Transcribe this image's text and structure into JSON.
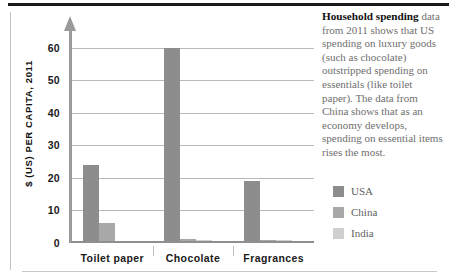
{
  "chart_data": {
    "type": "bar",
    "title": "",
    "xlabel": "",
    "ylabel": "$ (US) PER CAPITA, 2011",
    "ylim": [
      0,
      63
    ],
    "yticks": [
      0,
      10,
      20,
      30,
      40,
      50,
      60
    ],
    "grid": true,
    "legend_position": "right",
    "categories": [
      "Toilet paper",
      "Chocolate",
      "Fragrances"
    ],
    "series": [
      {
        "name": "USA",
        "color": "#8d8d8d",
        "values": [
          24,
          60,
          19
        ]
      },
      {
        "name": "China",
        "color": "#a8a8a8",
        "values": [
          6,
          1.2,
          1
        ]
      },
      {
        "name": "India",
        "color": "#cfcfcf",
        "values": [
          0.6,
          0.8,
          0.8
        ]
      }
    ]
  },
  "caption": {
    "lead": "Household spending",
    "body": " data from 2011 shows that US spending on luxury goods (such as chocolate) outstripped spending on essentials (like toilet paper). The data from China shows that as an economy develops, spending on essential items rises the most."
  },
  "legend": {
    "items": [
      {
        "label": "USA"
      },
      {
        "label": "China"
      },
      {
        "label": "India"
      }
    ]
  }
}
